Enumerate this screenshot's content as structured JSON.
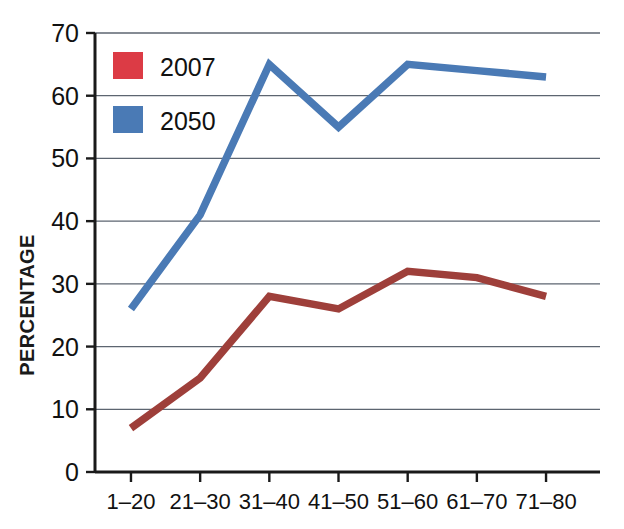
{
  "chart_data": {
    "type": "line",
    "title": "",
    "subtitle": "",
    "xlabel": "",
    "ylabel": "PERCENTAGE",
    "categories": [
      "1–20",
      "21–30",
      "31–40",
      "41–50",
      "51–60",
      "61–70",
      "71–80"
    ],
    "series": [
      {
        "name": "2007",
        "color": "#9e3f3a",
        "legend_swatch_color": "#dc3b45",
        "values": [
          7,
          15,
          28,
          26,
          32,
          31,
          28
        ]
      },
      {
        "name": "2050",
        "color": "#4a7ab5",
        "legend_swatch_color": "#4a7ab5",
        "values": [
          26,
          41,
          65,
          55,
          65,
          64,
          63
        ]
      }
    ],
    "ylim": [
      0,
      70
    ],
    "ytick_values": [
      0,
      10,
      20,
      30,
      40,
      50,
      60,
      70
    ],
    "ytick_labels": [
      "0",
      "10",
      "20",
      "30",
      "40",
      "50",
      "60",
      "70"
    ],
    "grid": true,
    "grid_axis": "y",
    "legend_position": "upper-left-inside",
    "legend_entries": [
      "2007",
      "2050"
    ]
  },
  "axes": {
    "y_axis_title": "PERCENTAGE"
  },
  "legend": {
    "items": [
      {
        "label": "2007",
        "swatch": "red-swatch"
      },
      {
        "label": "2050",
        "swatch": "blue-swatch"
      }
    ]
  },
  "colors": {
    "red_line": "#9e3f3a",
    "red_swatch": "#dc3b45",
    "blue_line": "#4a7ab5",
    "blue_swatch": "#4a7ab5",
    "gridline": "#5d6570",
    "axis": "#1a1a1a",
    "background": "#ffffff",
    "text": "#111111"
  }
}
